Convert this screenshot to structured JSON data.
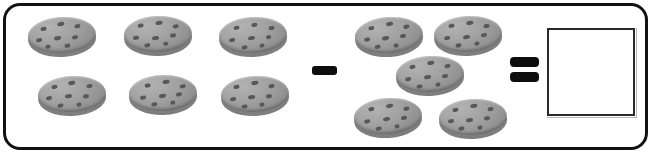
{
  "worksheet": {
    "type": "subtraction-picture-problem",
    "frame_color": "#121212",
    "background_color": "#ffffff",
    "minuend_count": 6,
    "subtrahend_count": 5,
    "answer_value": "",
    "operator_minus": "−",
    "operator_equals": "=",
    "cookie_body_color": "#a5a5a5",
    "cookie_chip_color": "#585858",
    "cookie_rim_color": "#7e7e7e"
  },
  "minuend_group": {
    "name": "left-cookie-group",
    "count": 6,
    "item_label": "cookie",
    "cookies": [
      {
        "x": 28,
        "y": 17,
        "rot": -3,
        "chips": [
          [
            13,
            9,
            6,
            4
          ],
          [
            30,
            5,
            7,
            4
          ],
          [
            47,
            8,
            6,
            4
          ],
          [
            8,
            20,
            6,
            4
          ],
          [
            26,
            19,
            7,
            4
          ],
          [
            44,
            19,
            6,
            4
          ],
          [
            36,
            27,
            6,
            4
          ],
          [
            17,
            27,
            5,
            4
          ]
        ]
      },
      {
        "x": 124,
        "y": 16,
        "rot": -2,
        "chips": [
          [
            14,
            7,
            6,
            4
          ],
          [
            32,
            5,
            7,
            4
          ],
          [
            49,
            9,
            6,
            4
          ],
          [
            9,
            19,
            6,
            4
          ],
          [
            28,
            20,
            7,
            4
          ],
          [
            46,
            18,
            6,
            4
          ],
          [
            20,
            27,
            6,
            4
          ],
          [
            39,
            26,
            5,
            4
          ]
        ]
      },
      {
        "x": 219,
        "y": 17,
        "rot": -3,
        "chips": [
          [
            15,
            8,
            6,
            4
          ],
          [
            33,
            6,
            6,
            4
          ],
          [
            50,
            10,
            6,
            4
          ],
          [
            10,
            20,
            6,
            4
          ],
          [
            29,
            19,
            7,
            4
          ],
          [
            47,
            19,
            5,
            4
          ],
          [
            22,
            28,
            6,
            4
          ],
          [
            40,
            27,
            5,
            4
          ]
        ]
      },
      {
        "x": 38,
        "y": 76,
        "rot": -3,
        "chips": [
          [
            14,
            8,
            6,
            4
          ],
          [
            31,
            5,
            7,
            4
          ],
          [
            49,
            9,
            6,
            4
          ],
          [
            8,
            19,
            6,
            4
          ],
          [
            27,
            18,
            7,
            4
          ],
          [
            45,
            19,
            6,
            4
          ],
          [
            19,
            27,
            6,
            4
          ],
          [
            38,
            27,
            5,
            4
          ]
        ]
      },
      {
        "x": 129,
        "y": 75,
        "rot": -2,
        "chips": [
          [
            16,
            8,
            6,
            4
          ],
          [
            34,
            5,
            7,
            4
          ],
          [
            51,
            10,
            6,
            4
          ],
          [
            11,
            20,
            6,
            4
          ],
          [
            30,
            19,
            7,
            4
          ],
          [
            47,
            18,
            6,
            4
          ],
          [
            22,
            27,
            6,
            4
          ],
          [
            41,
            26,
            5,
            4
          ]
        ]
      },
      {
        "x": 221,
        "y": 76,
        "rot": -3,
        "chips": [
          [
            13,
            8,
            6,
            4
          ],
          [
            31,
            5,
            7,
            4
          ],
          [
            48,
            9,
            6,
            4
          ],
          [
            9,
            20,
            6,
            4
          ],
          [
            27,
            19,
            7,
            4
          ],
          [
            45,
            19,
            6,
            4
          ],
          [
            20,
            28,
            6,
            4
          ],
          [
            38,
            27,
            5,
            4
          ]
        ]
      }
    ]
  },
  "minus_sign": {
    "name": "minus-operator",
    "glyph": "−",
    "x": 312,
    "y": 66,
    "width": 25,
    "height": 9
  },
  "subtrahend_group": {
    "name": "right-cookie-group",
    "count": 5,
    "item_label": "cookie",
    "cookies": [
      {
        "x": 355,
        "y": 17,
        "rot": -4,
        "chips": [
          [
            14,
            8,
            6,
            4
          ],
          [
            32,
            5,
            7,
            4
          ],
          [
            49,
            9,
            6,
            4
          ],
          [
            9,
            19,
            6,
            4
          ],
          [
            27,
            19,
            7,
            4
          ],
          [
            45,
            18,
            6,
            4
          ],
          [
            19,
            27,
            6,
            4
          ],
          [
            38,
            27,
            5,
            4
          ]
        ]
      },
      {
        "x": 434,
        "y": 16,
        "rot": -3,
        "chips": [
          [
            15,
            7,
            6,
            4
          ],
          [
            33,
            5,
            7,
            4
          ],
          [
            50,
            9,
            6,
            4
          ],
          [
            10,
            19,
            6,
            4
          ],
          [
            29,
            19,
            7,
            4
          ],
          [
            47,
            18,
            6,
            4
          ],
          [
            21,
            27,
            6,
            4
          ],
          [
            40,
            26,
            5,
            4
          ]
        ]
      },
      {
        "x": 396,
        "y": 56,
        "rot": -3,
        "chips": [
          [
            14,
            8,
            6,
            4
          ],
          [
            32,
            5,
            7,
            4
          ],
          [
            49,
            9,
            6,
            4
          ],
          [
            9,
            20,
            6,
            4
          ],
          [
            28,
            19,
            7,
            4
          ],
          [
            46,
            19,
            6,
            4
          ],
          [
            20,
            28,
            6,
            4
          ],
          [
            39,
            27,
            5,
            4
          ]
        ]
      },
      {
        "x": 354,
        "y": 98,
        "rot": -4,
        "chips": [
          [
            15,
            8,
            6,
            4
          ],
          [
            33,
            6,
            7,
            4
          ],
          [
            50,
            10,
            6,
            4
          ],
          [
            10,
            20,
            6,
            4
          ],
          [
            29,
            19,
            7,
            4
          ],
          [
            47,
            19,
            6,
            4
          ],
          [
            21,
            28,
            6,
            4
          ],
          [
            40,
            27,
            5,
            4
          ]
        ]
      },
      {
        "x": 439,
        "y": 99,
        "rot": -3,
        "chips": [
          [
            14,
            8,
            6,
            4
          ],
          [
            32,
            5,
            7,
            4
          ],
          [
            49,
            9,
            6,
            4
          ],
          [
            9,
            19,
            6,
            4
          ],
          [
            27,
            19,
            7,
            4
          ],
          [
            45,
            18,
            6,
            4
          ],
          [
            19,
            27,
            6,
            4
          ],
          [
            38,
            27,
            5,
            4
          ]
        ]
      }
    ]
  },
  "equals_sign": {
    "name": "equals-operator",
    "glyph": "=",
    "bar_x": 510,
    "bar_width": 29,
    "bar_height": 10,
    "top_y": 57,
    "bottom_y": 72
  },
  "answer_box": {
    "name": "answer-input-box",
    "value": "",
    "placeholder": "",
    "x": 547,
    "y": 28,
    "width": 88,
    "height": 88
  }
}
